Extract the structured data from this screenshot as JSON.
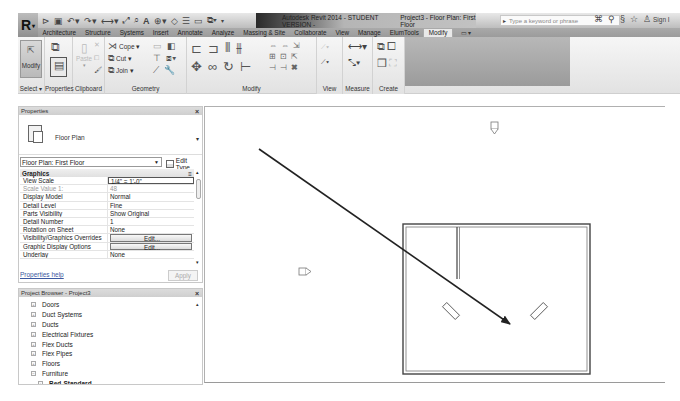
{
  "app": {
    "title": "Autodesk Revit 2014 - STUDENT VERSION -",
    "document": "Project3 - Floor Plan: First Floor",
    "logo_letter": "R"
  },
  "quick_access": {
    "icons": [
      "open-icon",
      "save-icon",
      "undo-icon",
      "redo-icon",
      "measure-icon",
      "dimension-icon",
      "tag-icon",
      "text-icon",
      "3d-view-icon",
      "section-icon",
      "thin-lines-icon",
      "close-hidden-icon",
      "switch-windows-icon"
    ]
  },
  "search": {
    "placeholder": "Type a keyword or phrase"
  },
  "header_right": {
    "sign_in": "Sign I"
  },
  "ribbon": {
    "tabs": [
      {
        "label": "Architecture"
      },
      {
        "label": "Structure"
      },
      {
        "label": "Systems"
      },
      {
        "label": "Insert"
      },
      {
        "label": "Annotate"
      },
      {
        "label": "Analyze"
      },
      {
        "label": "Massing & Site"
      },
      {
        "label": "Collaborate"
      },
      {
        "label": "View"
      },
      {
        "label": "Manage"
      },
      {
        "label": "ElumTools"
      },
      {
        "label": "Modify",
        "active": true
      }
    ],
    "panels": {
      "select": {
        "label": "Select ▾",
        "modify_button": "Modify"
      },
      "properties": {
        "label": "Properties"
      },
      "clipboard": {
        "label": "Clipboard",
        "paste": "Paste"
      },
      "geometry": {
        "label": "Geometry",
        "cope": "Cope ▾",
        "cut": "Cut ▾",
        "join": "Join ▾"
      },
      "modify": {
        "label": "Modify"
      },
      "view": {
        "label": "View"
      },
      "measure": {
        "label": "Measure"
      },
      "create": {
        "label": "Create"
      }
    }
  },
  "properties": {
    "header": "Properties",
    "type_name": "Floor Plan",
    "instance_selector": "Floor Plan: First Floor",
    "edit_type": "Edit Type",
    "group": "Graphics",
    "rows": [
      {
        "name": "View Scale",
        "value": "1/4\" = 1'-0\"",
        "style": "boxed"
      },
      {
        "name": "Scale Value    1:",
        "value": "48",
        "style": "dim"
      },
      {
        "name": "Display Model",
        "value": "Normal"
      },
      {
        "name": "Detail Level",
        "value": "Fine"
      },
      {
        "name": "Parts Visibility",
        "value": "Show Original"
      },
      {
        "name": "Detail Number",
        "value": "1"
      },
      {
        "name": "Rotation on Sheet",
        "value": "None"
      },
      {
        "name": "Visibility/Graphics Overrides",
        "value": "Edit...",
        "style": "btn"
      },
      {
        "name": "Graphic Display Options",
        "value": "Edit...",
        "style": "btn"
      },
      {
        "name": "Underlay",
        "value": "None"
      }
    ],
    "help_link": "Properties help",
    "apply": "Apply"
  },
  "project_browser": {
    "header": "Project Browser - Project3",
    "items": [
      {
        "label": "Doors",
        "expander": "+"
      },
      {
        "label": "Duct Systems",
        "expander": "+"
      },
      {
        "label": "Ducts",
        "expander": "+"
      },
      {
        "label": "Electrical Fixtures",
        "expander": "+"
      },
      {
        "label": "Flex Ducts",
        "expander": "+"
      },
      {
        "label": "Flex Pipes",
        "expander": "+"
      },
      {
        "label": "Floors",
        "expander": "+"
      },
      {
        "label": "Furniture",
        "expander": "−"
      },
      {
        "label": "Bed-Standard",
        "expander": "+",
        "child": true
      }
    ]
  },
  "canvas": {
    "elevation_markers": [
      "north-elevation",
      "west-elevation"
    ],
    "annotation": "arrow pointing to room"
  }
}
